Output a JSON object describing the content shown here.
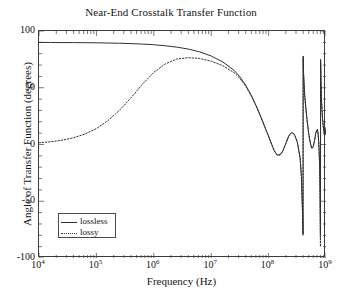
{
  "chart_data": {
    "type": "line",
    "title": "Near-End Crosstalk Transfer Function",
    "xlabel": "Frequency (Hz)",
    "ylabel": "Angle of Transfer Function (degrees)",
    "xscale": "log",
    "xlim": [
      10000,
      1000000000
    ],
    "ylim": [
      -100,
      100
    ],
    "grid": false,
    "legend_position": "lower left",
    "xticks": [
      {
        "value": 10000,
        "label": "10",
        "exponent": "4"
      },
      {
        "value": 100000,
        "label": "10",
        "exponent": "5"
      },
      {
        "value": 1000000,
        "label": "10",
        "exponent": "6"
      },
      {
        "value": 10000000,
        "label": "10",
        "exponent": "7"
      },
      {
        "value": 100000000,
        "label": "10",
        "exponent": "8"
      },
      {
        "value": 1000000000,
        "label": "10",
        "exponent": "9"
      }
    ],
    "yticks": [
      {
        "value": 100,
        "label": "100"
      },
      {
        "value": 50,
        "label": "50"
      },
      {
        "value": 0,
        "label": "0"
      },
      {
        "value": -50,
        "label": "-50"
      },
      {
        "value": -100,
        "label": "-100"
      }
    ],
    "series": [
      {
        "name": "lossless",
        "style": "solid",
        "color": "#303030",
        "points": [
          [
            10000,
            89.9
          ],
          [
            15849,
            89.9
          ],
          [
            25119,
            89.8
          ],
          [
            39811,
            89.8
          ],
          [
            63096,
            89.7
          ],
          [
            100000,
            89.6
          ],
          [
            158489,
            89.4
          ],
          [
            251189,
            89.2
          ],
          [
            398107,
            88.9
          ],
          [
            631000,
            88.5
          ],
          [
            1000000,
            87.9
          ],
          [
            1584893,
            87.0
          ],
          [
            2511886,
            85.8
          ],
          [
            3981072,
            84.1
          ],
          [
            6309573,
            81.6
          ],
          [
            10000000,
            78.0
          ],
          [
            15848932,
            72.8
          ],
          [
            25118864,
            65.3
          ],
          [
            31622777,
            59.6
          ],
          [
            39810717,
            52.3
          ],
          [
            50118723,
            43.2
          ],
          [
            63095734,
            32.3
          ],
          [
            79432823,
            19.9
          ],
          [
            100000000,
            7.2
          ],
          [
            112201845,
            0.6
          ],
          [
            125892541,
            -5.6
          ],
          [
            141253754,
            -9.2
          ],
          [
            158489319,
            -9.1
          ],
          [
            177827941,
            -5.5
          ],
          [
            199526231,
            0.9
          ],
          [
            223872114,
            7.4
          ],
          [
            251188643,
            10.6
          ],
          [
            281838293,
            9.0
          ],
          [
            316227766,
            2.1
          ],
          [
            354813389,
            -12.0
          ],
          [
            372759372,
            -28.0
          ],
          [
            389045145,
            -58.0
          ],
          [
            398107171,
            -79.0
          ],
          [
            400000000,
            78.0
          ],
          [
            407380278,
            62.0
          ],
          [
            426579519,
            43.0
          ],
          [
            446683592,
            32.0
          ],
          [
            467735141,
            22.0
          ],
          [
            501187234,
            9.5
          ],
          [
            530884444,
            2.0
          ],
          [
            562341325,
            -3.0
          ],
          [
            595662144,
            -2.0
          ],
          [
            630957344,
            3.5
          ],
          [
            668343918,
            11.0
          ],
          [
            707945784,
            13.5
          ],
          [
            724435960,
            11.0
          ],
          [
            749894209,
            1.5
          ],
          [
            772681536,
            -16.0
          ],
          [
            785236152,
            -38.0
          ],
          [
            794328235,
            -64.0
          ],
          [
            800000000,
            -81.0
          ],
          [
            805842188,
            75.0
          ],
          [
            816000000,
            58.0
          ],
          [
            831763771,
            42.0
          ],
          [
            851138038,
            31.0
          ],
          [
            870963590,
            23.0
          ],
          [
            891250938,
            17.5
          ],
          [
            912010839,
            13.0
          ],
          [
            933254301,
            10.0
          ],
          [
            954992586,
            9.0
          ],
          [
            977237221,
            10.5
          ],
          [
            1000000000,
            15.0
          ]
        ]
      },
      {
        "name": "lossy",
        "style": "dotted",
        "color": "#303030",
        "points": [
          [
            10000,
            1.5
          ],
          [
            15849,
            2.4
          ],
          [
            25119,
            3.8
          ],
          [
            39811,
            5.9
          ],
          [
            63096,
            9.2
          ],
          [
            100000,
            14.0
          ],
          [
            158489,
            21.0
          ],
          [
            251189,
            30.0
          ],
          [
            398107,
            41.0
          ],
          [
            631000,
            53.0
          ],
          [
            1000000,
            63.5
          ],
          [
            1584893,
            71.0
          ],
          [
            2511886,
            75.3
          ],
          [
            3981072,
            76.5
          ],
          [
            6309573,
            75.8
          ],
          [
            10000000,
            73.4
          ],
          [
            15848932,
            69.5
          ],
          [
            25118864,
            63.2
          ],
          [
            31622777,
            58.2
          ],
          [
            39810717,
            51.4
          ],
          [
            50118723,
            42.7
          ],
          [
            63095734,
            32.0
          ],
          [
            79432823,
            19.7
          ],
          [
            100000000,
            7.1
          ],
          [
            112201845,
            0.5
          ],
          [
            125892541,
            -5.7
          ],
          [
            141253754,
            -9.3
          ],
          [
            158489319,
            -9.2
          ],
          [
            177827941,
            -5.6
          ],
          [
            199526231,
            0.8
          ],
          [
            223872114,
            7.3
          ],
          [
            251188643,
            10.5
          ],
          [
            281838293,
            8.9
          ],
          [
            316227766,
            2.0
          ],
          [
            354813389,
            -12.5
          ],
          [
            372759372,
            -29.0
          ],
          [
            389045145,
            -59.0
          ],
          [
            398107171,
            -80.0
          ],
          [
            400000000,
            76.0
          ],
          [
            407380278,
            60.0
          ],
          [
            426579519,
            42.0
          ],
          [
            446683592,
            31.0
          ],
          [
            467735141,
            21.0
          ],
          [
            501187234,
            9.0
          ],
          [
            530884444,
            1.5
          ],
          [
            562341325,
            -3.5
          ],
          [
            595662144,
            -2.5
          ],
          [
            630957344,
            3.0
          ],
          [
            668343918,
            10.5
          ],
          [
            707945784,
            13.0
          ],
          [
            724435960,
            10.0
          ],
          [
            749894209,
            0.5
          ],
          [
            772681536,
            -18.0
          ],
          [
            785236152,
            -40.0
          ],
          [
            794328235,
            -66.0
          ],
          [
            800000000,
            -90.0
          ],
          [
            805842188,
            72.0
          ],
          [
            816000000,
            56.0
          ],
          [
            831763771,
            40.0
          ],
          [
            851138038,
            30.0
          ],
          [
            870963590,
            22.0
          ],
          [
            891250938,
            16.5
          ],
          [
            912010839,
            12.0
          ],
          [
            933254301,
            9.0
          ],
          [
            954992586,
            8.0
          ],
          [
            977237221,
            9.5
          ],
          [
            1000000000,
            14.0
          ]
        ]
      }
    ]
  }
}
